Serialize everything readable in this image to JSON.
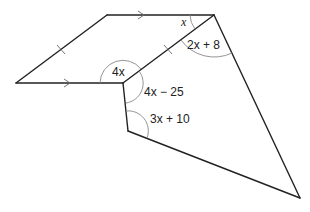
{
  "diagram": {
    "type": "geometry-figure",
    "colors": {
      "line": "#222222",
      "arc": "#888888",
      "text": "#222222",
      "background": "#ffffff"
    },
    "shapes": [
      {
        "name": "parallelogram",
        "vertices": [
          "left",
          "top-left",
          "top-right",
          "inner"
        ]
      },
      {
        "name": "quadrilateral",
        "vertices": [
          "top-right",
          "inner",
          "lower",
          "bottom-right"
        ]
      }
    ],
    "markings": {
      "parallel_arrows": [
        "top-edge",
        "bottom-edge"
      ],
      "equal_ticks": [
        "left-slant-edge",
        "shared-diagonal-edge"
      ]
    },
    "angles": [
      {
        "vertex": "top-right",
        "label_var": "x",
        "label_rest": "",
        "region": "parallelogram"
      },
      {
        "vertex": "top-right",
        "label_var": "2x",
        "label_rest": " + 8",
        "region": "quadrilateral"
      },
      {
        "vertex": "inner",
        "label_var": "4x",
        "label_rest": "",
        "region": "parallelogram-reflex"
      },
      {
        "vertex": "inner",
        "label_var": "4x",
        "label_rest": " − 25",
        "region": "quadrilateral"
      },
      {
        "vertex": "lower",
        "label_var": "3x",
        "label_rest": " + 10",
        "region": "quadrilateral"
      }
    ]
  }
}
